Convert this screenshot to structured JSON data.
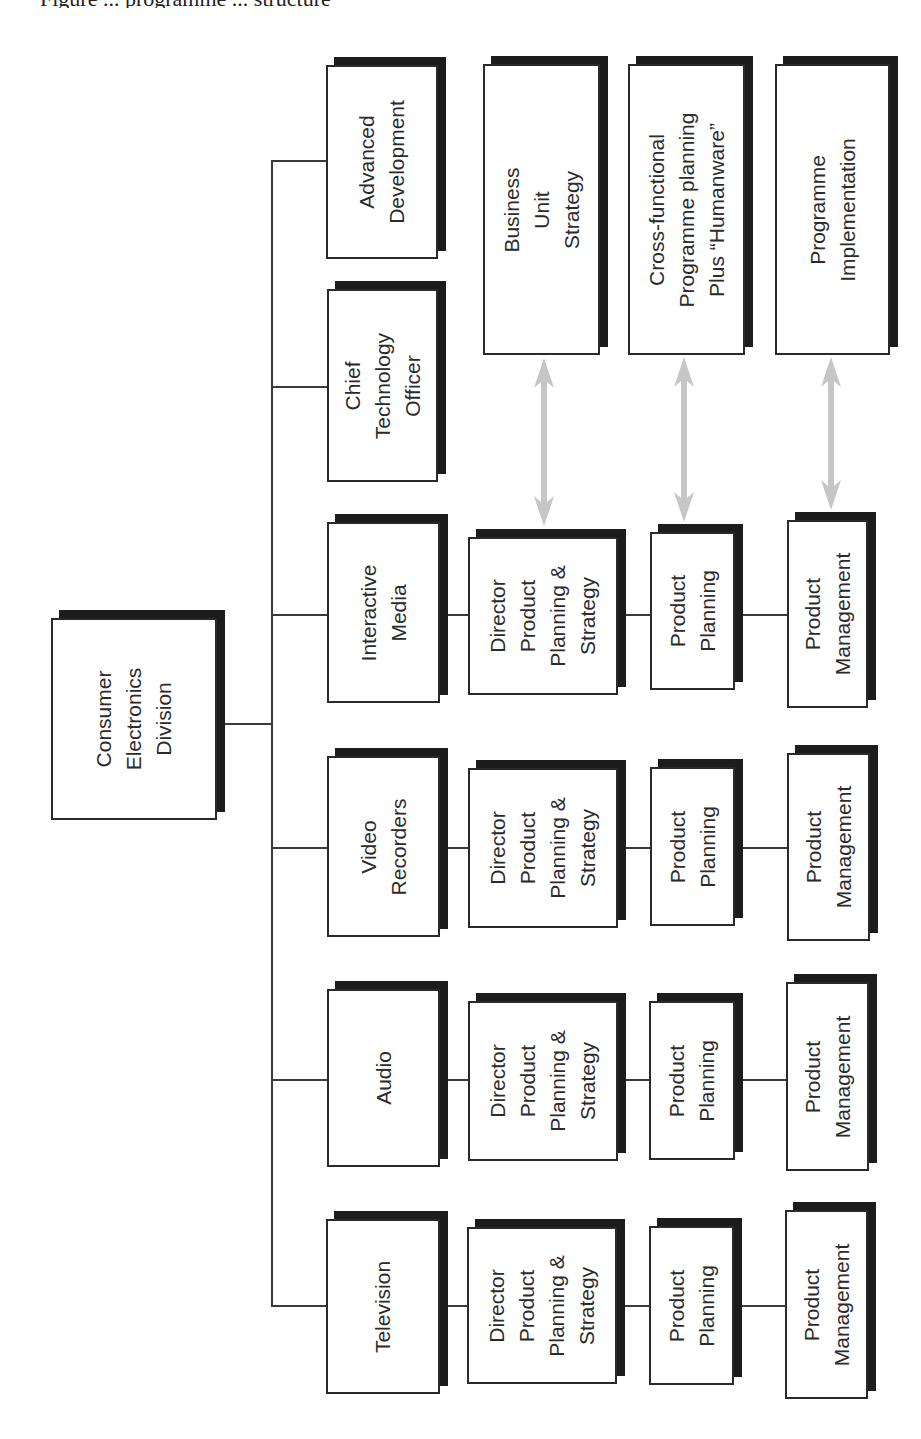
{
  "diagram": {
    "title_partial": "Figure ... programme ... structure",
    "root": {
      "id": "ced",
      "label": "Consumer\nElectronics\nDivision",
      "rect": [
        51,
        618,
        166,
        202
      ]
    },
    "trunk": {
      "x": 271,
      "y1": 160,
      "y2": 1306
    },
    "root_connector": {
      "y": 723,
      "x1": 217,
      "x2": 271
    },
    "top_level": [
      {
        "id": "advanced-development",
        "label": "Advanced\nDevelopment",
        "rect": [
          326,
          65,
          112,
          194
        ],
        "connector_y": 160
      },
      {
        "id": "chief-technology-officer",
        "label": "Chief\nTechnology\nOfficer",
        "rect": [
          327,
          289,
          111,
          193
        ],
        "connector_y": 386
      },
      {
        "id": "interactive-media",
        "label": "Interactive\nMedia",
        "rect": [
          327,
          522,
          113,
          181
        ],
        "connector_y": 614
      },
      {
        "id": "video-recorders",
        "label": "Video\nRecorders",
        "rect": [
          327,
          756,
          113,
          181
        ],
        "connector_y": 847
      },
      {
        "id": "audio",
        "label": "Audio",
        "rect": [
          327,
          989,
          113,
          178
        ],
        "connector_y": 1079
      },
      {
        "id": "television",
        "label": "Television",
        "rect": [
          326,
          1219,
          114,
          175
        ],
        "connector_y": 1305
      }
    ],
    "business_rows": [
      {
        "parent": "interactive-media",
        "connector_y": 614,
        "director": {
          "label": "Director\nProduct\nPlanning &\nStrategy",
          "rect": [
            468,
            537,
            150,
            158
          ]
        },
        "planning": {
          "label": "Product\nPlanning",
          "rect": [
            650,
            532,
            85,
            158
          ]
        },
        "management": {
          "label": "Product\nManagement",
          "rect": [
            787,
            520,
            81,
            188
          ]
        }
      },
      {
        "parent": "video-recorders",
        "connector_y": 847,
        "director": {
          "label": "Director\nProduct\nPlanning &\nStrategy",
          "rect": [
            468,
            768,
            150,
            160
          ]
        },
        "planning": {
          "label": "Product\nPlanning",
          "rect": [
            650,
            767,
            85,
            159
          ]
        },
        "management": {
          "label": "Product\nManagement",
          "rect": [
            787,
            753,
            83,
            188
          ]
        }
      },
      {
        "parent": "audio",
        "connector_y": 1079,
        "director": {
          "label": "Director\nProduct\nPlanning &\nStrategy",
          "rect": [
            468,
            1001,
            150,
            160
          ]
        },
        "planning": {
          "label": "Product\nPlanning",
          "rect": [
            649,
            1001,
            86,
            159
          ]
        },
        "management": {
          "label": "Product\nManagement",
          "rect": [
            786,
            982,
            83,
            189
          ]
        }
      },
      {
        "parent": "television",
        "connector_y": 1305,
        "director": {
          "label": "Director\nProduct\nPlanning &\nStrategy",
          "rect": [
            467,
            1227,
            150,
            157
          ]
        },
        "planning": {
          "label": "Product\nPlanning",
          "rect": [
            649,
            1226,
            85,
            159
          ]
        },
        "management": {
          "label": "Product\nManagement",
          "rect": [
            785,
            1210,
            83,
            189
          ]
        }
      }
    ],
    "process_boxes": [
      {
        "id": "business-unit-strategy",
        "label": "Business\nUnit\nStrategy",
        "rect": [
          483,
          64,
          117,
          291
        ]
      },
      {
        "id": "cross-functional-programme-planning",
        "label": "Cross-functional\nProgramme planning\nPlus “Humanware”",
        "rect": [
          628,
          64,
          117,
          291
        ]
      },
      {
        "id": "programme-implementation",
        "label": "Programme\nImplementation",
        "rect": [
          775,
          64,
          115,
          291
        ]
      }
    ],
    "arrows": [
      {
        "from": "business-unit-strategy",
        "to": "director-product-planning-strategy",
        "x": 544,
        "y1": 358,
        "y2": 526
      },
      {
        "from": "cross-functional-programme-planning",
        "to": "product-planning",
        "x": 684,
        "y1": 357,
        "y2": 522
      },
      {
        "from": "programme-implementation",
        "to": "product-management",
        "x": 831,
        "y1": 357,
        "y2": 510
      }
    ],
    "style": {
      "shadow_offset": [
        8,
        -8
      ],
      "shadow_color": "#1c1c1c",
      "border_color": "#2a2a2a",
      "line_color": "#3a3a3a",
      "arrow_color": "#c6c6c6",
      "background": "#ffffff"
    }
  }
}
